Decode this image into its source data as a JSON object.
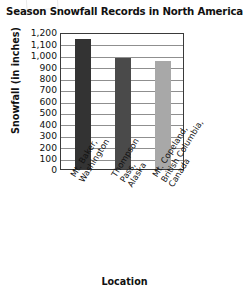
{
  "chart_data": {
    "type": "bar",
    "title": "Season Snowfall Records in North America",
    "xlabel": "Location",
    "ylabel": "Snowfall (in inches)",
    "categories": [
      "Mt. Baker, Washington",
      "Thompson Pass, Alaska",
      "Mt. Copeland, British Columbia, Canada"
    ],
    "category_lines": [
      [
        "Mt. Baker,",
        "Washington"
      ],
      [
        "Thompson",
        "Pass,",
        "Alaska"
      ],
      [
        "Mt. Copeland,",
        "British Columbia,",
        "Canada"
      ]
    ],
    "values": [
      1140,
      975,
      950
    ],
    "ylim": [
      0,
      1200
    ],
    "ytick_values": [
      1200,
      1100,
      1000,
      900,
      800,
      700,
      600,
      500,
      400,
      300,
      200,
      100,
      0
    ],
    "ytick_labels": [
      "1,200",
      "1,100",
      "1,000",
      "900",
      "800",
      "700",
      "600",
      "500",
      "400",
      "300",
      "200",
      "100",
      "0"
    ],
    "grid": true,
    "legend": "none",
    "bar_colors": [
      "#333333",
      "#4a4a4a",
      "#a8a8a8"
    ],
    "axis_color": "#3a3a3a",
    "grid_color": "#8f8f8f",
    "background": "#ffffff"
  }
}
